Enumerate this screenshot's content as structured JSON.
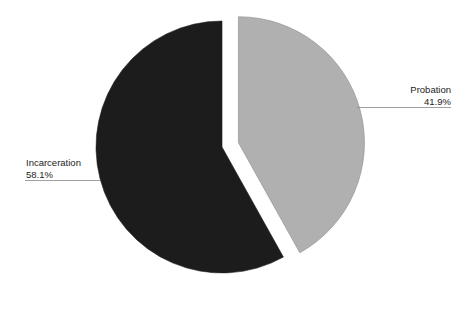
{
  "chart_data": {
    "type": "pie",
    "title": "",
    "categories": [
      "Probation",
      "Incarceration"
    ],
    "values": [
      41.9,
      58.1
    ],
    "unit": "%",
    "labels": [
      "41.9%",
      "58.1%"
    ],
    "colors": [
      "#b0b0b0",
      "#1c1c1c"
    ],
    "exploded": [
      "Probation"
    ],
    "start_angle_deg": 0,
    "direction": "clockwise",
    "legend": "none",
    "label_style": "outside with leader lines"
  },
  "labels": {
    "probation": {
      "name": "Probation",
      "pct": "41.9%"
    },
    "incarceration": {
      "name": "Incarceration",
      "pct": "58.1%"
    }
  }
}
